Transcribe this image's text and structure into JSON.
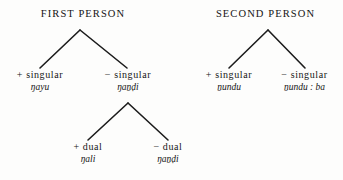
{
  "figure": {
    "background_color": "#fdfdfc",
    "ink_color": "#161616",
    "line_color": "#1c1c1c"
  },
  "trees": [
    {
      "heading": "FIRST PERSON",
      "root": {
        "children": [
          {
            "feature": "+ singular",
            "form": "ŋayu"
          },
          {
            "feature": "− singular",
            "form": "ŋaṉḍi",
            "children": [
              {
                "feature": "+ dual",
                "form": "ŋali"
              },
              {
                "feature": "− dual",
                "form": "ŋaṉḍi"
              }
            ]
          }
        ]
      }
    },
    {
      "heading": "SECOND PERSON",
      "root": {
        "children": [
          {
            "feature": "+ singular",
            "form": "ṉundu"
          },
          {
            "feature": "− singular",
            "form": "ṉundu : ba"
          }
        ]
      }
    }
  ],
  "labels": {
    "first_person_heading": "FIRST PERSON",
    "second_person_heading": "SECOND PERSON",
    "t1_left_feature": "+ singular",
    "t1_left_form": "ŋayu",
    "t1_right_feature": "− singular",
    "t1_right_form": "ŋaṉḍi",
    "t1_sub_left_feature": "+ dual",
    "t1_sub_left_form": "ŋali",
    "t1_sub_right_feature": "− dual",
    "t1_sub_right_form": "ŋaṉḍi",
    "t2_left_feature": "+ singular",
    "t2_left_form": "ṉundu",
    "t2_right_feature": "− singular",
    "t2_right_form": "ṉundu : ba"
  }
}
